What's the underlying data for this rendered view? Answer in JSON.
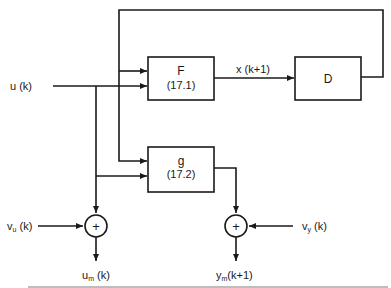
{
  "diagram": {
    "blocks": [
      {
        "id": "F",
        "title": "F",
        "ref": "(17.1)"
      },
      {
        "id": "D",
        "title": "D",
        "ref": ""
      },
      {
        "id": "g",
        "title": "g",
        "ref": "(17.2)"
      }
    ],
    "signals": {
      "input": "u (k)",
      "state_next": "x (k+1)",
      "input_noise": "v",
      "input_noise_sub": "u",
      "input_noise_arg": " (k)",
      "output_noise": "v",
      "output_noise_sub": "y",
      "output_noise_arg": " (k)",
      "measured_input": "u",
      "measured_input_sub": "m",
      "measured_input_arg": " (k)",
      "measured_output": "y",
      "measured_output_sub": "m",
      "measured_output_arg": "(k+1)"
    },
    "summing_junctions": [
      {
        "id": "sum-input",
        "symbol": "+"
      },
      {
        "id": "sum-output",
        "symbol": "+"
      }
    ],
    "colors": {
      "stroke": "#1a1a1a",
      "background": "#ffffff"
    }
  }
}
